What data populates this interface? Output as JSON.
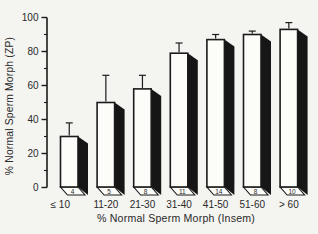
{
  "figure": {
    "background": "#f4f4f1",
    "ink": "#1b1b1b",
    "text_color": "#2a2a2a"
  },
  "chart_data": {
    "type": "bar",
    "title": "",
    "xlabel": "% Normal Sperm Morph (Insem)",
    "ylabel": "% Normal Sperm Morph (ZP)",
    "categories": [
      "≤ 10",
      "11-20",
      "21-30",
      "31-40",
      "41-50",
      "51-60",
      "> 60"
    ],
    "values": [
      30,
      50,
      58,
      79,
      87,
      90,
      93
    ],
    "error_plus": [
      8,
      16,
      8,
      6,
      3,
      2,
      4
    ],
    "bar_counts": [
      "4",
      "5",
      "8",
      "11",
      "14",
      "8",
      "10"
    ],
    "ylim": [
      0,
      100
    ],
    "yticks": [
      0,
      20,
      40,
      60,
      80,
      100
    ],
    "yticks_minor": [
      10,
      30,
      50,
      70,
      90
    ],
    "grid": false,
    "legend": null,
    "bar_fill": "#fcfcf9",
    "bar_side_fill": "#161616",
    "note": "3D offset bars with one-sided SD error bars; n per group shown in bar base"
  }
}
